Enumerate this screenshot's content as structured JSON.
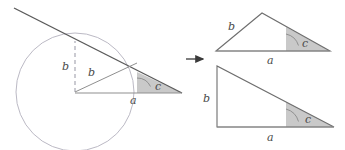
{
  "figure": {
    "colors": {
      "stroke_dark": "#555555",
      "stroke_light": "#9a9a9a",
      "circle_stroke": "#b0aebb",
      "dashed_stroke": "#a9a9b4",
      "angle_fill": "#c9c9c9",
      "angle_stroke": "#8a8a8a",
      "label_color": "#4a4a4a",
      "arrow_color": "#3a3a3a",
      "background": "#ffffff"
    }
  },
  "left_diagram": {
    "name": "circle-with-tangent-line",
    "circle": {
      "cx": 75,
      "cy": 92,
      "r": 59
    },
    "tangent_line": {
      "x1": 14,
      "y1": 8,
      "x2": 182,
      "y2": 93
    },
    "dashed_segment": {
      "x1": 75,
      "y1": 92,
      "x2": 75,
      "y2": 41
    },
    "radius_segment": {
      "x1": 75,
      "y1": 92,
      "x2": 137,
      "y2": 63
    },
    "base_segment": {
      "x1": 75,
      "y1": 93,
      "x2": 182,
      "y2": 93
    },
    "angle_label": "c",
    "labels": [
      {
        "text": "b",
        "x": 64,
        "y": 67,
        "name": "label-b-vertical"
      },
      {
        "text": "b",
        "x": 90,
        "y": 74,
        "name": "label-b-radius"
      },
      {
        "text": "a",
        "x": 133,
        "y": 101,
        "name": "label-a-base"
      },
      {
        "text": "c",
        "x": 159,
        "y": 89,
        "name": "label-c-angle"
      }
    ]
  },
  "arrow": {
    "name": "transform-arrow",
    "x1": 186,
    "y1": 59,
    "x2": 206,
    "y2": 59,
    "glyph": "right-arrow"
  },
  "top_right_triangle": {
    "name": "isosceles-triangle",
    "vertices": [
      {
        "x": 216,
        "y": 51
      },
      {
        "x": 262,
        "y": 13
      },
      {
        "x": 330,
        "y": 51
      }
    ],
    "angle_label": "c",
    "labels": [
      {
        "text": "b",
        "x": 231,
        "y": 27,
        "name": "label-b-side"
      },
      {
        "text": "a",
        "x": 270,
        "y": 62,
        "name": "label-a-base"
      },
      {
        "text": "c",
        "x": 305,
        "y": 45,
        "name": "label-c-angle"
      }
    ]
  },
  "bottom_right_triangle": {
    "name": "right-triangle",
    "vertices": [
      {
        "x": 217,
        "y": 127
      },
      {
        "x": 217,
        "y": 66
      },
      {
        "x": 334,
        "y": 127
      }
    ],
    "angle_label": "c",
    "labels": [
      {
        "text": "b",
        "x": 206,
        "y": 99,
        "name": "label-b-height"
      },
      {
        "text": "a",
        "x": 270,
        "y": 139,
        "name": "label-a-base"
      },
      {
        "text": "c",
        "x": 308,
        "y": 121,
        "name": "label-c-angle"
      }
    ]
  }
}
